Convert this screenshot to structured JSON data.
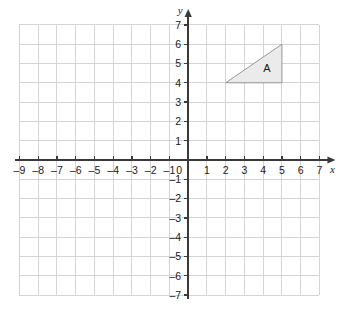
{
  "chart_data": {
    "type": "scatter",
    "title": "",
    "xlabel": "x",
    "ylabel": "y",
    "xlim": [
      -9,
      7
    ],
    "ylim": [
      -7,
      7
    ],
    "grid": true,
    "legend": "none",
    "x_ticks": [
      -9,
      -8,
      -7,
      -6,
      -5,
      -4,
      -3,
      -2,
      -1,
      0,
      1,
      2,
      3,
      4,
      5,
      6,
      7
    ],
    "y_ticks": [
      7,
      6,
      5,
      4,
      3,
      2,
      1,
      -1,
      -2,
      -3,
      -4,
      -5,
      -6,
      -7
    ],
    "x_tick_labels": [
      "–9",
      "–8",
      "–7",
      "–6",
      "–5",
      "–4",
      "–3",
      "–2",
      "–1",
      "0",
      "1",
      "2",
      "3",
      "4",
      "5",
      "6",
      "7"
    ],
    "y_tick_labels": [
      "7",
      "6",
      "5",
      "4",
      "3",
      "2",
      "1",
      "–1",
      "–2",
      "–3",
      "–4",
      "–5",
      "–6",
      "–7"
    ],
    "origin_label": "0",
    "shapes": [
      {
        "name": "A",
        "label": "A",
        "kind": "triangle",
        "vertices": [
          [
            2,
            4
          ],
          [
            5,
            4
          ],
          [
            5,
            6
          ]
        ],
        "label_position": [
          4.2,
          4.75
        ],
        "fill": "#ebebeb",
        "stroke": "#8c8c8c"
      }
    ],
    "colors": {
      "grid": "#cfcfcf",
      "axis": "#3a3a3a",
      "text": "#1a1a1a",
      "background": "#ffffff"
    }
  },
  "axes": {
    "x_axis_name": "x",
    "y_axis_name": "y"
  }
}
